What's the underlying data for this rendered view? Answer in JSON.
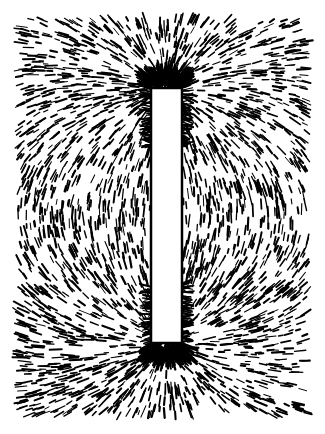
{
  "image": {
    "subject": "Iron filings aligned along the magnetic field lines of a bar magnet",
    "background_color": "#ffffff",
    "ink_color": "#000000",
    "canvas": {
      "width": 325,
      "height": 434
    },
    "field_region": {
      "x": 18,
      "y": 18,
      "width": 290,
      "height": 398
    },
    "magnet": {
      "x": 151,
      "y": 88,
      "width": 31,
      "height": 255,
      "fill": "#ffffff"
    },
    "poles": [
      {
        "name": "top-pole",
        "x": 166,
        "y": 88
      },
      {
        "name": "bottom-pole",
        "x": 166,
        "y": 343
      }
    ],
    "filings": {
      "count": 2600,
      "min_length": 4,
      "max_length": 13,
      "stroke_width": 1.6,
      "seed": 7
    }
  }
}
